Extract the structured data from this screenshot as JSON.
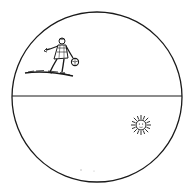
{
  "diagram": {
    "style": "antique woodcut engraving",
    "colors": {
      "ink": "#1a1a1a",
      "paper": "#ffffff"
    },
    "globe": {
      "cx": 97,
      "cy": 97,
      "r": 85
    },
    "horizon_line": {
      "y": 96
    },
    "upper_half": {
      "figure": "walking man carrying a ball",
      "ground": "hatched ground strip"
    },
    "lower_half": {
      "object": "sun with rays and face"
    }
  }
}
